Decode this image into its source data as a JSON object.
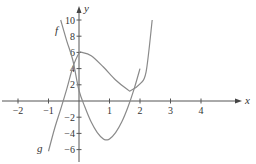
{
  "chart_data": {
    "type": "line",
    "title": "",
    "xlabel": "x",
    "ylabel": "y",
    "xlim": [
      -2.6,
      5.3
    ],
    "ylim": [
      -7.7,
      11
    ],
    "grid": false,
    "x_ticks": [
      -2,
      -1,
      1,
      2,
      3,
      4
    ],
    "y_ticks": [
      -6,
      -4,
      -2,
      2,
      4,
      6,
      8,
      10
    ],
    "series": [
      {
        "name": "f",
        "description": "parabola, derivative of g",
        "x": [
          -0.6,
          -0.4,
          -0.2,
          0,
          0.2,
          0.4,
          0.6,
          0.8,
          0.9,
          1.0,
          1.2,
          1.4,
          1.6,
          1.8,
          2.0
        ],
        "y": [
          10.0,
          7.4,
          5.0,
          1.3,
          -0.8,
          -2.6,
          -3.9,
          -4.7,
          -4.8,
          -4.7,
          -3.9,
          -2.6,
          -0.8,
          1.4,
          4.0
        ]
      },
      {
        "name": "g",
        "description": "cubic with local max ~6 near x=0.1 and local min ~1.3 near x=1.7",
        "x": [
          -1.0,
          -0.8,
          -0.6,
          -0.4,
          -0.2,
          0,
          0.1,
          0.4,
          0.8,
          1.2,
          1.6,
          1.7,
          2.0,
          2.2,
          2.4
        ],
        "y": [
          -6.2,
          -3.4,
          -1.0,
          1.5,
          4.2,
          5.9,
          6.0,
          5.6,
          4.2,
          2.6,
          1.4,
          1.3,
          2.1,
          3.6,
          10.0
        ]
      }
    ],
    "annotations": [
      {
        "text": "f",
        "x": -0.72,
        "y": 8.8
      },
      {
        "text": "g",
        "x": -1.25,
        "y": -5.9
      }
    ]
  },
  "axes": {
    "x_label": "x",
    "y_label": "y",
    "x_tick_labels": [
      "−2",
      "−1",
      "1",
      "2",
      "3",
      "4"
    ],
    "y_tick_labels": [
      "−6",
      "−4",
      "−2",
      "2",
      "4",
      "6",
      "8",
      "10"
    ]
  },
  "labels": {
    "f": "f",
    "g": "g"
  }
}
